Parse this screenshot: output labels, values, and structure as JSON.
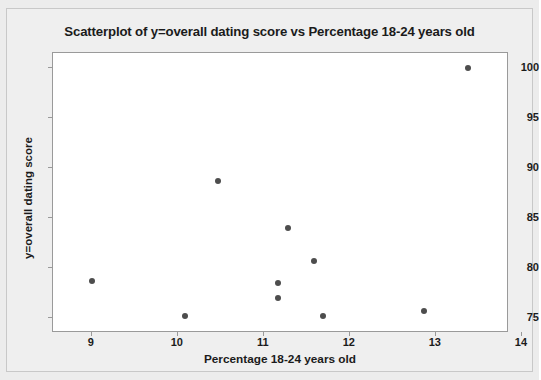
{
  "chart_data": {
    "type": "scatter",
    "title": "Scatterplot of y=overall dating score vs Percentage 18-24 years old",
    "xlabel": "Percentage 18-24 years old",
    "ylabel": "y=overall dating score",
    "xlim": [
      8.55,
      13.85
    ],
    "ylim": [
      73.5,
      101.5
    ],
    "xticks": [
      9,
      10,
      11,
      12,
      13,
      14
    ],
    "xtick_labels": [
      "9",
      "10",
      "11",
      "12",
      "13",
      "14"
    ],
    "yticks": [
      75,
      80,
      85,
      90,
      95,
      100
    ],
    "ytick_labels": [
      "75",
      "80",
      "85",
      "90",
      "95",
      "100"
    ],
    "grid": false,
    "legend": null,
    "marker_color": "#4d4d4d",
    "marker_size": 6,
    "points": [
      {
        "x": 9.0,
        "y": 78.7
      },
      {
        "x": 10.08,
        "y": 75.2
      },
      {
        "x": 10.47,
        "y": 88.7
      },
      {
        "x": 11.17,
        "y": 77.0
      },
      {
        "x": 11.17,
        "y": 78.5
      },
      {
        "x": 11.28,
        "y": 84.0
      },
      {
        "x": 11.58,
        "y": 80.7
      },
      {
        "x": 11.69,
        "y": 75.2
      },
      {
        "x": 12.86,
        "y": 75.7
      },
      {
        "x": 13.37,
        "y": 100.0
      }
    ]
  },
  "colors": {
    "background": "#ececec",
    "panel": "#efefef",
    "plot_background": "#ffffff",
    "axis": "#9a9a9a",
    "text": "#1b1b1b",
    "marker": "#4d4d4d"
  }
}
